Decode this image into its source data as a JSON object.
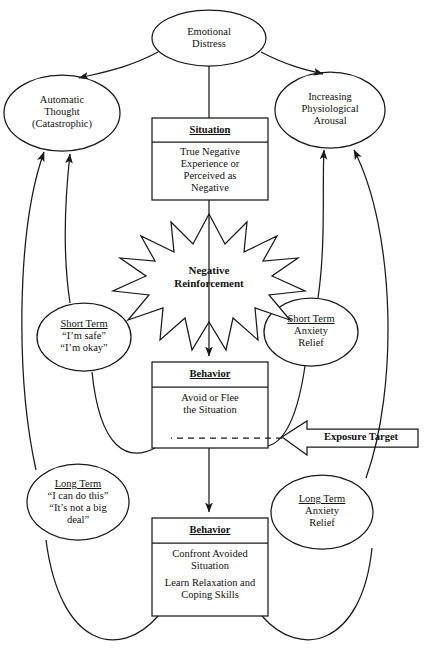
{
  "diagram": {
    "stroke_color": "#1a1a1a",
    "fill_color": "#ffffff",
    "nodes": {
      "emotional_distress": {
        "line1": "Emotional",
        "line2": "Distress"
      },
      "automatic_thought": {
        "line1": "Automatic",
        "line2": "Thought",
        "line3": "(Catastrophic)"
      },
      "increasing_arousal": {
        "line1": "Increasing",
        "line2": "Physiological",
        "line3": "Arousal"
      },
      "situation": {
        "header": "Situation",
        "line1": "True Negative",
        "line2": "Experience or",
        "line3": "Perceived as",
        "line4": "Negative"
      },
      "negative_reinforcement": {
        "line1": "Negative",
        "line2": "Reinforcement"
      },
      "short_term_thought": {
        "header": "Short Term",
        "line1": "“I’m safe”",
        "line2": "“I’m okay”"
      },
      "short_term_relief": {
        "header": "Short Term",
        "line1": "Anxiety",
        "line2": "Relief"
      },
      "behavior_avoid": {
        "header": "Behavior",
        "line1": "Avoid or Flee",
        "line2": "the Situation"
      },
      "exposure_target": {
        "label": "Exposure Target"
      },
      "long_term_thought": {
        "header": "Long Term",
        "line1": "“I can do this”",
        "line2": "“It’s not a big",
        "line3": "deal”"
      },
      "long_term_relief": {
        "header": "Long Term",
        "line1": "Anxiety",
        "line2": "Relief"
      },
      "behavior_confront": {
        "header": "Behavior",
        "line1": "Confront Avoided",
        "line2": "Situation",
        "line3": "Learn Relaxation and",
        "line4": "Coping Skills"
      }
    }
  }
}
